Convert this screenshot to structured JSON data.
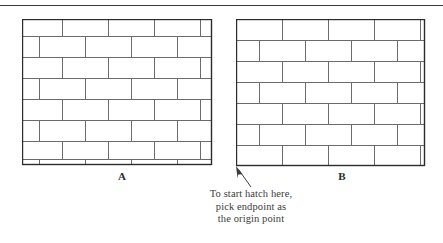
{
  "page": {
    "width": 443,
    "height": 243,
    "background": "#ffffff",
    "rule_color": "#3a3a3a"
  },
  "figures": [
    {
      "id": "figure-a",
      "label": "A",
      "label_x": 112,
      "label_y": 170,
      "x": 22,
      "y": 19,
      "width": 190,
      "height": 146,
      "border_color": "#2b2b2b",
      "hatch_color": "#6b6b6b",
      "origin_aligned": false,
      "brick_width": 46,
      "brick_height": 21,
      "row_offset_x": -6,
      "row_offset_y": -4,
      "note": "hatch pattern origin not snapped to corner: partial brick row clipped at top and bottom"
    },
    {
      "id": "figure-b",
      "label": "B",
      "label_x": 332,
      "label_y": 170,
      "x": 236,
      "y": 19,
      "width": 189,
      "height": 147,
      "border_color": "#2b2b2b",
      "hatch_color": "#6b6b6b",
      "origin_aligned": true,
      "brick_width": 46,
      "brick_height": 21,
      "row_offset_x": 0,
      "row_offset_y": 0,
      "note": "hatch origin picked at bottom-left endpoint: bricks start flush at lower-left corner"
    }
  ],
  "callout": {
    "lines": [
      "To start hatch here,",
      "pick endpoint as",
      "the origin point"
    ],
    "text_color": "#3b3b3b",
    "arrow": {
      "tip_x": 236,
      "tip_y": 166,
      "tail_x": 251,
      "tail_y": 187,
      "color": "#3b3b3b"
    }
  }
}
